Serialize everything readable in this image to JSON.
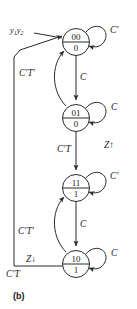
{
  "figure": {
    "caption": "(b)",
    "type": "state-transition-diagram",
    "input_variable_label": "y",
    "input_sub_1": "1",
    "input_var_2": "y",
    "input_sub_2": "2"
  },
  "states": [
    {
      "id": "s00",
      "code": "00",
      "output": "0",
      "self_loop_label": "C′",
      "cx": 76,
      "cy": 42
    },
    {
      "id": "s01",
      "code": "01",
      "output": "0",
      "self_loop_label": "C",
      "cx": 76,
      "cy": 118
    },
    {
      "id": "s11",
      "code": "11",
      "output": "1",
      "self_loop_label": "C′",
      "cx": 76,
      "cy": 188
    },
    {
      "id": "s10",
      "code": "10",
      "output": "1",
      "self_loop_label": "C",
      "cx": 76,
      "cy": 264
    }
  ],
  "transitions": [
    {
      "id": "t-00-01",
      "from": "00",
      "to": "01",
      "label": "C",
      "kind": "straight-down"
    },
    {
      "id": "t-01-00",
      "from": "01",
      "to": "00",
      "label": "C′T′",
      "kind": "curved-up-left"
    },
    {
      "id": "t-01-11",
      "from": "01",
      "to": "11",
      "label": "C′T",
      "kind": "straight-down"
    },
    {
      "id": "t-11-10",
      "from": "11",
      "to": "10",
      "label": "C",
      "kind": "straight-down"
    },
    {
      "id": "t-10-11",
      "from": "10",
      "to": "11",
      "label": "C′T′",
      "kind": "curved-up-left"
    },
    {
      "id": "t-10-00",
      "from": "10",
      "to": "00",
      "label": "C′T",
      "kind": "long-feedback-left"
    }
  ],
  "annotations": [
    {
      "id": "z-rise",
      "text": "Z↑",
      "near": "t-01-11"
    },
    {
      "id": "z-fall",
      "text": "Z↓",
      "near": "t-10-00"
    }
  ],
  "colors": {
    "stroke": "#2b2b2b",
    "text": "#1a1a1a",
    "background": "#ffffff"
  }
}
